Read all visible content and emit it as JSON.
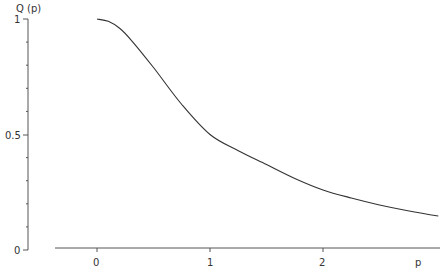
{
  "chart_data": {
    "type": "line",
    "title": "",
    "xlabel": "p",
    "ylabel": "Q (p)",
    "xlim": [
      -0.37,
      3.05
    ],
    "ylim": [
      0,
      1
    ],
    "grid": false,
    "legend": null,
    "x_ticks": [
      {
        "value": 0,
        "label": "0"
      },
      {
        "value": 1,
        "label": "1"
      },
      {
        "value": 2,
        "label": "2"
      }
    ],
    "y_ticks": [
      {
        "value": 0,
        "label": "0"
      },
      {
        "value": 0.5,
        "label": "0.5"
      },
      {
        "value": 1,
        "label": "1"
      }
    ],
    "y_minor_ticks": [
      0.1,
      0.2,
      0.3,
      0.4,
      0.6,
      0.7,
      0.8,
      0.9
    ],
    "series": [
      {
        "name": "Q(p)",
        "x": [
          0,
          0.1,
          0.2,
          0.3,
          0.5,
          0.75,
          1.0,
          1.25,
          1.5,
          1.75,
          2.0,
          2.25,
          2.5,
          2.75,
          3.02
        ],
        "y": [
          1.0,
          0.99,
          0.96,
          0.91,
          0.79,
          0.63,
          0.5,
          0.43,
          0.37,
          0.31,
          0.26,
          0.225,
          0.195,
          0.17,
          0.147
        ]
      }
    ]
  },
  "labels": {
    "y_axis_title": "Q (p)",
    "x_axis_title": "p",
    "y_tick_1": "1",
    "y_tick_05": "0.5",
    "y_tick_0": "0",
    "x_tick_0": "0",
    "x_tick_1": "1",
    "x_tick_2": "2"
  }
}
